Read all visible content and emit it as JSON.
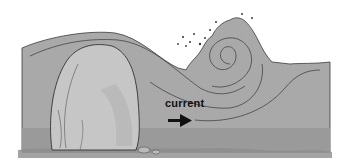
{
  "diagram": {
    "labels": {
      "current": "current"
    },
    "elements": [
      "water",
      "rock",
      "breaking-wave",
      "spray-droplets",
      "current-lines",
      "current-arrow",
      "seabed"
    ],
    "colors": {
      "water": "#a7a7a7",
      "water_dark": "#959595",
      "rock": "#c4c4c4",
      "outline": "#3a3a3a",
      "background": "#ffffff",
      "seabed": "#8c8c8c"
    }
  }
}
